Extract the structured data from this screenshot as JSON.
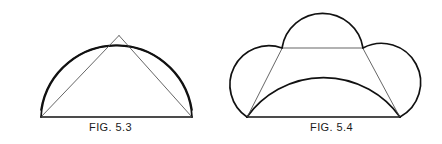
{
  "plate": {
    "background_color": "#ffffff",
    "stroke_color": "#111111",
    "thin_stroke_color": "#4a4a4a",
    "width": 442,
    "height": 144
  },
  "figures": [
    {
      "id": "fig-5-3",
      "caption": "FIG. 5.3",
      "description": "Two large circular arcs erected on the halves of a horizontal base, crossing at an apex; two thin chords run from the base endpoints up to the apex.",
      "geometry": {
        "base_left": [
          41,
          117
        ],
        "base_right": [
          192,
          117
        ],
        "apex": [
          119,
          35
        ],
        "arc_peak_y": 18,
        "arc_left_extent_x": 22,
        "arc_right_extent_x": 211,
        "arcs": [
          {
            "name": "left-large-arc",
            "from": [
              41,
              117
            ],
            "to": [
              186,
              40
            ],
            "bulge": "up-left"
          },
          {
            "name": "right-large-arc",
            "from": [
              192,
              117
            ],
            "to": [
              47,
              40
            ],
            "bulge": "up-right"
          }
        ],
        "chords": [
          {
            "name": "left-chord",
            "from": [
              41,
              117
            ],
            "to": [
              119,
              35
            ]
          },
          {
            "name": "right-chord",
            "from": [
              192,
              117
            ],
            "to": [
              119,
              35
            ]
          }
        ]
      }
    },
    {
      "id": "fig-5-4",
      "caption": "FIG. 5.4",
      "description": "A trapezoid with a large arc spanning its base, a semicircular arc on its top edge, and two semicircular arcs on its slanted sides; thin chords join the base corners to the upper corners.",
      "geometry": {
        "base_left": [
          247,
          117
        ],
        "base_right": [
          400,
          117
        ],
        "top_left": [
          282,
          48
        ],
        "top_right": [
          363,
          48
        ],
        "top_arc_peak": [
          323,
          12
        ],
        "side_arc_left_extent_x": 222,
        "side_arc_right_extent_x": 425,
        "base_arc_peak_y": 45,
        "chords": [
          {
            "name": "left-chord",
            "from": [
              247,
              117
            ],
            "to": [
              282,
              48
            ]
          },
          {
            "name": "right-chord",
            "from": [
              400,
              117
            ],
            "to": [
              363,
              48
            ]
          }
        ]
      }
    }
  ]
}
